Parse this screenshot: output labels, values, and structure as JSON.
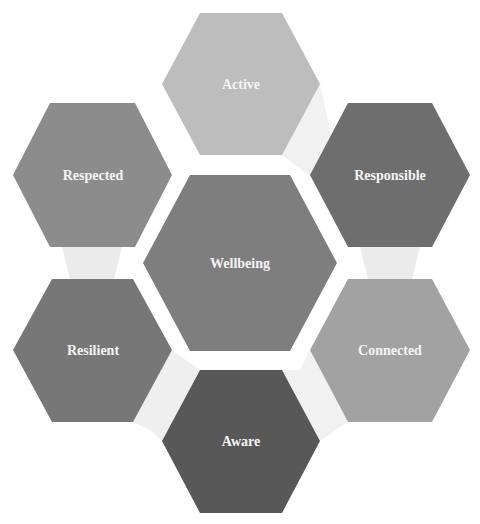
{
  "diagram": {
    "type": "hexagon-cluster",
    "center": {
      "label": "Wellbeing",
      "color": "#7e7e7e"
    },
    "nodes": [
      {
        "id": "active",
        "label": "Active",
        "color": "#bdbdbd"
      },
      {
        "id": "responsible",
        "label": "Responsible",
        "color": "#6e6e6e"
      },
      {
        "id": "connected",
        "label": "Connected",
        "color": "#a2a2a2"
      },
      {
        "id": "aware",
        "label": "Aware",
        "color": "#585858"
      },
      {
        "id": "resilient",
        "label": "Resilient",
        "color": "#777777"
      },
      {
        "id": "respected",
        "label": "Respected",
        "color": "#8c8c8c"
      }
    ],
    "connectors": [
      {
        "from": "Active",
        "to": "Responsible"
      },
      {
        "from": "Responsible",
        "to": "Connected"
      },
      {
        "from": "Connected",
        "to": "Aware"
      },
      {
        "from": "Aware",
        "to": "Resilient"
      },
      {
        "from": "Resilient",
        "to": "Respected"
      }
    ],
    "connector_color": "#ececec",
    "text_color": "#f4f4f4"
  }
}
